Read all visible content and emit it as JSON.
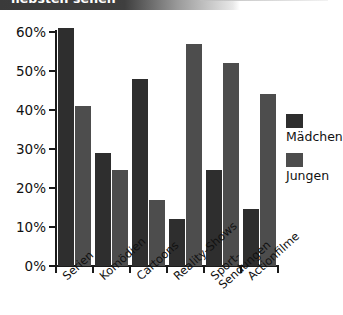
{
  "title": {
    "text": "liebsten sehen"
  },
  "legend": {
    "position": "right",
    "items": [
      {
        "label": "Mädchen",
        "color": "#2e2e2e"
      },
      {
        "label": "Jungen",
        "color": "#4d4d4d"
      }
    ]
  },
  "axis": {
    "y_ticks": [
      "0%",
      "10%",
      "20%",
      "30%",
      "40%",
      "50%",
      "60%"
    ]
  },
  "chart_data": {
    "type": "bar",
    "title": "liebsten sehen",
    "xlabel": "",
    "ylabel": "",
    "ylim": [
      0,
      60
    ],
    "ytick_values": [
      0,
      10,
      20,
      30,
      40,
      50,
      60
    ],
    "ytick_labels": [
      "0%",
      "10%",
      "20%",
      "30%",
      "40%",
      "50%",
      "60%"
    ],
    "grid": false,
    "legend_position": "right",
    "categories": [
      "Serien",
      "Komödien",
      "Cartoons",
      "Reality-Shows",
      "Sport-Sendungen",
      "Actionfilme"
    ],
    "series": [
      {
        "name": "Mädchen",
        "color": "#2e2e2e",
        "values": [
          61,
          29,
          48,
          12,
          24.5,
          14.5
        ]
      },
      {
        "name": "Jungen",
        "color": "#4d4d4d",
        "values": [
          41,
          24.5,
          17,
          57,
          52,
          44
        ]
      }
    ],
    "units": "percent"
  }
}
